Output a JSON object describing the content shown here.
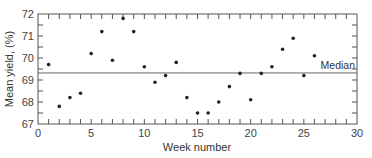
{
  "chart_data": {
    "type": "scatter",
    "title": "",
    "xlabel": "Week number",
    "ylabel": "Mean yield, (%)",
    "xlim": [
      0,
      30
    ],
    "ylim": [
      67,
      72
    ],
    "x_ticks": [
      0,
      5,
      10,
      15,
      20,
      25,
      30
    ],
    "y_ticks": [
      67,
      68,
      69,
      70,
      71,
      72
    ],
    "grid": false,
    "legend": null,
    "series": [
      {
        "name": "Mean yield",
        "x": [
          1,
          2,
          3,
          4,
          5,
          6,
          7,
          8,
          9,
          10,
          11,
          12,
          13,
          14,
          15,
          16,
          17,
          18,
          19,
          20,
          21,
          22,
          23,
          24,
          25,
          26
        ],
        "y": [
          69.7,
          67.8,
          68.2,
          68.4,
          70.2,
          71.2,
          69.9,
          71.8,
          71.2,
          69.6,
          68.9,
          69.2,
          69.8,
          68.2,
          67.5,
          67.5,
          68.0,
          68.7,
          69.3,
          68.1,
          69.3,
          69.6,
          70.4,
          70.9,
          69.2,
          70.1
        ]
      }
    ],
    "reference_lines": [
      {
        "type": "horizontal",
        "value": 69.32,
        "label": "Median"
      }
    ],
    "colors": {
      "axis": "#555555",
      "points": "#222222",
      "median_line": "#666666"
    }
  }
}
